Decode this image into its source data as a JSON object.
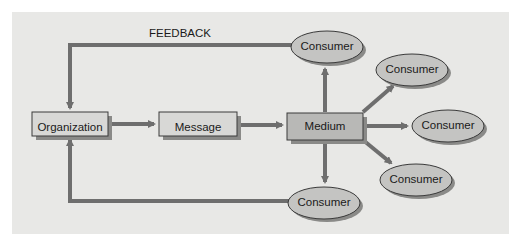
{
  "diagram": {
    "feedback_label": "FEEDBACK",
    "nodes": {
      "organization": "Organization",
      "message": "Message",
      "medium": "Medium",
      "consumer_top": "Consumer",
      "consumer_upper_right": "Consumer",
      "consumer_right": "Consumer",
      "consumer_lower_right": "Consumer",
      "consumer_bottom": "Consumer"
    },
    "colors": {
      "panel": "#e8e8e6",
      "box_fill": "#d8d8d6",
      "medium_fill": "#b8b8b6",
      "ellipse_fill": "#c4c4c2",
      "arrow": "#6e6e6e",
      "shadow": "#8a8a88"
    }
  }
}
